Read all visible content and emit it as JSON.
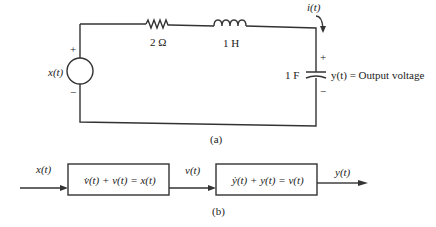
{
  "circuit": {
    "source_label": "x(t)",
    "source_plus": "+",
    "source_minus": "−",
    "resistor_label": "2 Ω",
    "inductor_label": "1 H",
    "current_label": "i(t)",
    "capacitor_label": "1 F",
    "cap_plus": "+",
    "cap_minus": "−",
    "output_label": "y(t) = Output voltage",
    "caption": "(a)"
  },
  "block_diagram": {
    "input_label": "x(t)",
    "block1_eq": "v̇(t) + v(t) = x(t)",
    "mid_label": "v(t)",
    "block2_eq": "ẏ(t) + y(t) = v(t)",
    "output_label": "y(t)",
    "caption": "(b)"
  }
}
